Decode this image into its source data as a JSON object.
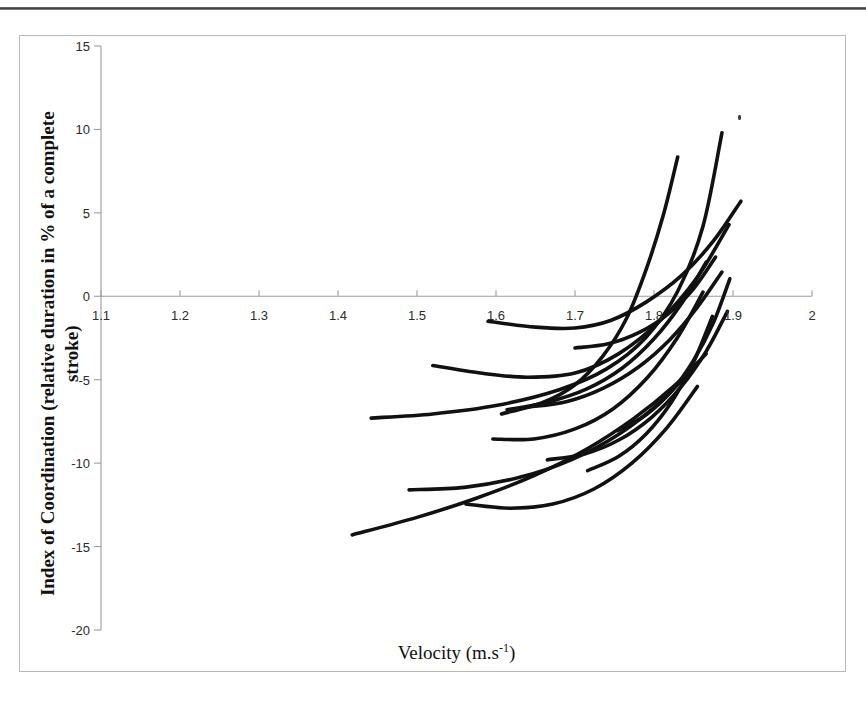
{
  "figure": {
    "x_axis_title_main": "Velocity (m.s",
    "x_axis_title_sup": "-1",
    "x_axis_title_close": ")",
    "y_axis_title_line1": "Index of Coordination (relative duration in % of a complete",
    "y_axis_title_line2": "stroke)"
  },
  "chart_data": {
    "type": "line",
    "title": "",
    "xlabel": "Velocity (m.s-1)",
    "ylabel": "Index of Coordination (relative duration in % of a complete stroke)",
    "xlim": [
      1.1,
      2.0
    ],
    "ylim": [
      -20,
      15
    ],
    "xticks": [
      "1.1",
      "1.2",
      "1.3",
      "1.4",
      "1.5",
      "1.6",
      "1.7",
      "1.8",
      "1.9",
      "2"
    ],
    "yticks": [
      "15",
      "10",
      "5",
      "0",
      "-5",
      "-10",
      "-15",
      "-20"
    ],
    "grid": false,
    "legend": "none",
    "line_color": "#111111",
    "axis_color": "#9d9d9d",
    "series": [
      {
        "name": "swimmer-01",
        "x": [
          1.442,
          1.52,
          1.6,
          1.68,
          1.74,
          1.79,
          1.83,
          1.862,
          1.886
        ],
        "y": [
          -7.3,
          -7.05,
          -6.55,
          -5.6,
          -4.35,
          -2.45,
          0.3,
          4.2,
          9.8
        ]
      },
      {
        "name": "swimmer-02",
        "x": [
          1.607,
          1.66,
          1.7,
          1.735,
          1.765,
          1.79,
          1.812,
          1.83
        ],
        "y": [
          -7.05,
          -6.35,
          -5.3,
          -3.6,
          -1.35,
          1.6,
          4.9,
          8.35
        ]
      },
      {
        "name": "swimmer-03",
        "x": [
          1.59,
          1.65,
          1.7,
          1.745,
          1.79,
          1.835,
          1.875,
          1.91
        ],
        "y": [
          -1.5,
          -1.85,
          -1.9,
          -1.45,
          -0.35,
          1.25,
          3.3,
          5.7
        ]
      },
      {
        "name": "swimmer-04",
        "x": [
          1.52,
          1.58,
          1.64,
          1.7,
          1.755,
          1.808,
          1.855,
          1.895
        ],
        "y": [
          -4.15,
          -4.6,
          -4.85,
          -4.6,
          -3.45,
          -1.45,
          1.15,
          4.3
        ]
      },
      {
        "name": "swimmer-05",
        "x": [
          1.614,
          1.665,
          1.715,
          1.76,
          1.8,
          1.836,
          1.866
        ],
        "y": [
          -6.8,
          -6.35,
          -5.55,
          -4.3,
          -2.55,
          -0.35,
          2.05
        ]
      },
      {
        "name": "swimmer-06",
        "x": [
          1.596,
          1.648,
          1.7,
          1.748,
          1.792,
          1.83,
          1.862
        ],
        "y": [
          -8.55,
          -8.55,
          -7.95,
          -6.75,
          -4.85,
          -2.45,
          0.25
        ]
      },
      {
        "name": "swimmer-07",
        "x": [
          1.64,
          1.69,
          1.736,
          1.78,
          1.82,
          1.855,
          1.886
        ],
        "y": [
          -6.65,
          -6.3,
          -5.5,
          -4.25,
          -2.6,
          -0.65,
          1.45
        ]
      },
      {
        "name": "swimmer-08",
        "x": [
          1.665,
          1.712,
          1.756,
          1.797,
          1.834,
          1.866,
          1.893
        ],
        "y": [
          -9.8,
          -9.45,
          -8.6,
          -7.25,
          -5.45,
          -3.3,
          -0.9
        ]
      },
      {
        "name": "swimmer-09",
        "x": [
          1.418,
          1.5,
          1.575,
          1.648,
          1.715,
          1.775,
          1.826,
          1.866
        ],
        "y": [
          -14.3,
          -13.25,
          -12.1,
          -10.75,
          -9.15,
          -7.3,
          -5.35,
          -3.45
        ]
      },
      {
        "name": "swimmer-10",
        "x": [
          1.49,
          1.56,
          1.63,
          1.695,
          1.756,
          1.81,
          1.856
        ],
        "y": [
          -11.6,
          -11.45,
          -10.85,
          -9.8,
          -8.25,
          -6.25,
          -3.95
        ]
      },
      {
        "name": "swimmer-11",
        "x": [
          1.562,
          1.618,
          1.672,
          1.724,
          1.772,
          1.816,
          1.855
        ],
        "y": [
          -12.45,
          -12.7,
          -12.45,
          -11.55,
          -10.0,
          -7.9,
          -5.4
        ]
      },
      {
        "name": "swimmer-12",
        "x": [
          1.716,
          1.755,
          1.79,
          1.822,
          1.85,
          1.874
        ],
        "y": [
          -10.45,
          -9.6,
          -8.25,
          -6.35,
          -3.95,
          -1.2
        ]
      },
      {
        "name": "swimmer-13",
        "x": [
          1.7,
          1.742,
          1.782,
          1.818,
          1.85,
          1.878
        ],
        "y": [
          -3.1,
          -2.85,
          -2.15,
          -1.05,
          0.45,
          2.35
        ]
      },
      {
        "name": "swimmer-14",
        "x": [
          1.754,
          1.79,
          1.822,
          1.85,
          1.875,
          1.896
        ],
        "y": [
          -8.05,
          -7.1,
          -5.7,
          -3.85,
          -1.6,
          1.05
        ]
      }
    ]
  }
}
